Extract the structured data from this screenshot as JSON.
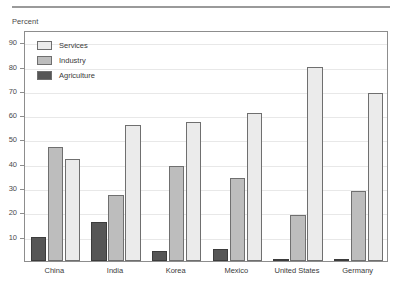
{
  "axis": {
    "y_axis_title": "Percent",
    "y_ticks": [
      "90",
      "80",
      "70",
      "60",
      "50",
      "40",
      "30",
      "20",
      "10"
    ]
  },
  "legend": {
    "items": [
      {
        "label": "Services",
        "color": "#ebebeb"
      },
      {
        "label": "Industry",
        "color": "#bdbdbd"
      },
      {
        "label": "Agriculture",
        "color": "#565656"
      }
    ]
  },
  "chart_data": {
    "type": "bar",
    "title": "",
    "subtitle": "",
    "xlabel": "",
    "ylabel": "Percent",
    "ylim": [
      0,
      95
    ],
    "grid": true,
    "legend_position": "top-left",
    "categories": [
      "China",
      "India",
      "Korea",
      "Mexico",
      "United States",
      "Germany"
    ],
    "series": [
      {
        "name": "Agriculture",
        "color": "#565656",
        "values": [
          10,
          16,
          4,
          5,
          1,
          1
        ]
      },
      {
        "name": "Industry",
        "color": "#bdbdbd",
        "values": [
          47,
          27,
          39,
          34,
          19,
          29
        ]
      },
      {
        "name": "Services",
        "color": "#ebebeb",
        "values": [
          42,
          56,
          57,
          61,
          80,
          69
        ]
      }
    ]
  }
}
